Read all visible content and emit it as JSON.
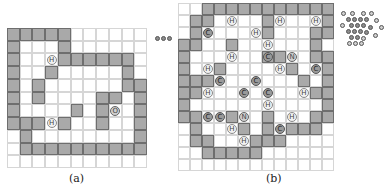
{
  "panel_a": {
    "caption": "(a)",
    "cols": 11,
    "rows": 11,
    "walls": [
      [
        0,
        0
      ],
      [
        0,
        1
      ],
      [
        0,
        2
      ],
      [
        0,
        3
      ],
      [
        0,
        4
      ],
      [
        1,
        0
      ],
      [
        1,
        4
      ],
      [
        2,
        0
      ],
      [
        2,
        4
      ],
      [
        2,
        5
      ],
      [
        2,
        6
      ],
      [
        2,
        7
      ],
      [
        2,
        8
      ],
      [
        2,
        9
      ],
      [
        3,
        0
      ],
      [
        3,
        3
      ],
      [
        3,
        9
      ],
      [
        4,
        0
      ],
      [
        4,
        2
      ],
      [
        4,
        9
      ],
      [
        4,
        10
      ],
      [
        5,
        0
      ],
      [
        5,
        2
      ],
      [
        5,
        7
      ],
      [
        5,
        8
      ],
      [
        5,
        10
      ],
      [
        6,
        0
      ],
      [
        6,
        5
      ],
      [
        6,
        7
      ],
      [
        6,
        10
      ],
      [
        7,
        0
      ],
      [
        7,
        1
      ],
      [
        7,
        2
      ],
      [
        7,
        4
      ],
      [
        7,
        7
      ],
      [
        7,
        10
      ],
      [
        8,
        1
      ],
      [
        8,
        10
      ],
      [
        9,
        1
      ],
      [
        9,
        2
      ],
      [
        9,
        3
      ],
      [
        9,
        4
      ],
      [
        9,
        5
      ],
      [
        9,
        6
      ],
      [
        9,
        7
      ],
      [
        9,
        8
      ],
      [
        9,
        9
      ],
      [
        9,
        10
      ]
    ],
    "atoms": [
      {
        "row": 2,
        "col": 3,
        "label": "H"
      },
      {
        "row": 6,
        "col": 8,
        "label": "O"
      },
      {
        "row": 7,
        "col": 3,
        "label": "H"
      }
    ]
  },
  "panel_b": {
    "caption": "(b)",
    "cols": 13,
    "rows": 14,
    "walls": [
      [
        0,
        2
      ],
      [
        0,
        3
      ],
      [
        0,
        4
      ],
      [
        0,
        5
      ],
      [
        0,
        6
      ],
      [
        0,
        7
      ],
      [
        0,
        8
      ],
      [
        0,
        9
      ],
      [
        0,
        10
      ],
      [
        0,
        11
      ],
      [
        0,
        12
      ],
      [
        1,
        1
      ],
      [
        1,
        2
      ],
      [
        1,
        7
      ],
      [
        1,
        12
      ],
      [
        2,
        1
      ],
      [
        2,
        7
      ],
      [
        2,
        11
      ],
      [
        2,
        12
      ],
      [
        3,
        0
      ],
      [
        3,
        1
      ],
      [
        3,
        4
      ],
      [
        3,
        11
      ],
      [
        4,
        0
      ],
      [
        4,
        7
      ],
      [
        4,
        8
      ],
      [
        4,
        11
      ],
      [
        4,
        12
      ],
      [
        5,
        0
      ],
      [
        5,
        3
      ],
      [
        5,
        9
      ],
      [
        5,
        12
      ],
      [
        6,
        0
      ],
      [
        6,
        1
      ],
      [
        6,
        2
      ],
      [
        6,
        10
      ],
      [
        6,
        12
      ],
      [
        7,
        0
      ],
      [
        7,
        1
      ],
      [
        7,
        11
      ],
      [
        7,
        12
      ],
      [
        8,
        0
      ],
      [
        8,
        12
      ],
      [
        9,
        0
      ],
      [
        9,
        1
      ],
      [
        9,
        4
      ],
      [
        9,
        7
      ],
      [
        9,
        11
      ],
      [
        9,
        12
      ],
      [
        10,
        1
      ],
      [
        10,
        5
      ],
      [
        10,
        7
      ],
      [
        10,
        9
      ],
      [
        10,
        10
      ],
      [
        10,
        11
      ],
      [
        11,
        1
      ],
      [
        11,
        2
      ],
      [
        11,
        6
      ],
      [
        11,
        7
      ],
      [
        11,
        8
      ],
      [
        12,
        2
      ],
      [
        12,
        3
      ],
      [
        12,
        4
      ],
      [
        12,
        5
      ],
      [
        12,
        6
      ]
    ],
    "atoms": [
      {
        "row": 1,
        "col": 4,
        "label": "H"
      },
      {
        "row": 1,
        "col": 8,
        "label": "H"
      },
      {
        "row": 1,
        "col": 11,
        "label": "H"
      },
      {
        "row": 2,
        "col": 2,
        "label": "C"
      },
      {
        "row": 2,
        "col": 6,
        "label": "H"
      },
      {
        "row": 3,
        "col": 7,
        "label": "H"
      },
      {
        "row": 4,
        "col": 4,
        "label": "H"
      },
      {
        "row": 4,
        "col": 7,
        "label": "C"
      },
      {
        "row": 4,
        "col": 9,
        "label": "N"
      },
      {
        "row": 5,
        "col": 2,
        "label": "H"
      },
      {
        "row": 5,
        "col": 8,
        "label": "H"
      },
      {
        "row": 5,
        "col": 11,
        "label": "C"
      },
      {
        "row": 6,
        "col": 3,
        "label": "C"
      },
      {
        "row": 6,
        "col": 6,
        "label": "C"
      },
      {
        "row": 7,
        "col": 2,
        "label": "H"
      },
      {
        "row": 7,
        "col": 5,
        "label": "C"
      },
      {
        "row": 7,
        "col": 7,
        "label": "C"
      },
      {
        "row": 7,
        "col": 10,
        "label": "H"
      },
      {
        "row": 8,
        "col": 7,
        "label": "H"
      },
      {
        "row": 9,
        "col": 2,
        "label": "C"
      },
      {
        "row": 9,
        "col": 3,
        "label": "C"
      },
      {
        "row": 9,
        "col": 5,
        "label": "N"
      },
      {
        "row": 9,
        "col": 9,
        "label": "H"
      },
      {
        "row": 10,
        "col": 4,
        "label": "H"
      },
      {
        "row": 10,
        "col": 8,
        "label": "C"
      },
      {
        "row": 11,
        "col": 5,
        "label": "H"
      }
    ]
  },
  "side_molecules": {
    "left_chain_atoms": 3,
    "right_cluster": "fused-ring molecule thumbnail"
  }
}
